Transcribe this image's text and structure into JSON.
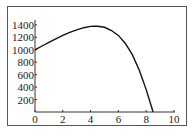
{
  "chart_data": {
    "type": "line",
    "title": "",
    "xlabel": "",
    "ylabel": "",
    "xlim": [
      0,
      10
    ],
    "ylim": [
      0,
      1450
    ],
    "x_ticks": [
      "0",
      "2",
      "4",
      "6",
      "8",
      "10"
    ],
    "y_ticks": [
      "200",
      "400",
      "600",
      "800",
      "1000",
      "1200",
      "1400"
    ],
    "grid": false,
    "legend": null,
    "series": [
      {
        "name": "curve",
        "x": [
          0,
          0.5,
          1,
          1.5,
          2,
          2.5,
          3,
          3.5,
          4,
          4.3,
          4.5,
          5,
          5.5,
          6,
          6.5,
          7,
          7.5,
          8,
          8.5
        ],
        "values": [
          1000,
          1060,
          1120,
          1175,
          1230,
          1280,
          1320,
          1355,
          1375,
          1380,
          1378,
          1360,
          1310,
          1230,
          1100,
          920,
          670,
          360,
          0
        ]
      }
    ]
  }
}
